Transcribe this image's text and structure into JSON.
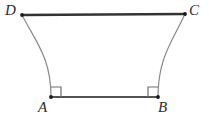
{
  "figure": {
    "type": "geometry-diagram",
    "background_color": "#ffffff",
    "vertices": [
      {
        "id": "A",
        "label": "A",
        "x": 51,
        "y": 97,
        "label_x": 38,
        "label_y": 100
      },
      {
        "id": "B",
        "label": "B",
        "x": 158,
        "y": 97,
        "label_x": 158,
        "label_y": 100
      },
      {
        "id": "C",
        "label": "C",
        "x": 185,
        "y": 14,
        "label_x": 189,
        "label_y": 3
      },
      {
        "id": "D",
        "label": "D",
        "x": 22,
        "y": 15,
        "label_x": 5,
        "label_y": 3
      }
    ],
    "segments": [
      {
        "name": "segment-DC",
        "from": "D",
        "to": "C",
        "color": "#333333",
        "width": 2.4,
        "style": "straight"
      },
      {
        "name": "segment-AB",
        "from": "A",
        "to": "B",
        "color": "#1a1a1a",
        "width": 1.6,
        "style": "straight"
      }
    ],
    "arcs": [
      {
        "name": "arc-DA",
        "from": "D",
        "to": "A",
        "color": "#8a8a8a",
        "width": 1.2,
        "path": "M 22 15 C 36 42 51 58 51 97"
      },
      {
        "name": "arc-CB",
        "from": "C",
        "to": "B",
        "color": "#8a8a8a",
        "width": 1.2,
        "path": "M 185 14 C 172 42 158 58 158 97"
      }
    ],
    "right_angle_markers": [
      {
        "name": "right-angle-marker-A",
        "at": "A",
        "size": 10,
        "color": "#6f6f6f",
        "width": 1.2,
        "path": "M 51 87 L 61 87 L 61 97"
      },
      {
        "name": "right-angle-marker-B",
        "at": "B",
        "size": 10,
        "color": "#6f6f6f",
        "width": 1.2,
        "path": "M 158 87 L 148 87 L 148 97"
      }
    ],
    "vertex_dot": {
      "radius": 1.9,
      "color": "#1a1a1a"
    }
  }
}
